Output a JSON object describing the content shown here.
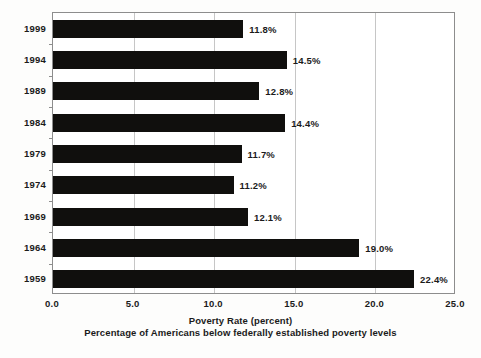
{
  "chart_data": {
    "type": "bar",
    "orientation": "horizontal",
    "title": "",
    "xlabel": "Poverty Rate (percent)",
    "subtitle": "Percentage of Americans below federally established poverty levels",
    "ylabel": "",
    "categories": [
      "1999",
      "1994",
      "1989",
      "1984",
      "1979",
      "1974",
      "1969",
      "1964",
      "1959"
    ],
    "values": [
      11.8,
      14.5,
      12.8,
      14.4,
      11.7,
      11.2,
      12.1,
      19.0,
      22.4
    ],
    "value_labels": [
      "11.8%",
      "14.5%",
      "12.8%",
      "14.4%",
      "11.7%",
      "11.2%",
      "12.1%",
      "19.0%",
      "22.4%"
    ],
    "xlim": [
      0.0,
      25.0
    ],
    "xticks": [
      0.0,
      5.0,
      10.0,
      15.0,
      20.0,
      25.0
    ],
    "xtick_labels": [
      "0.0",
      "5.0",
      "10.0",
      "15.0",
      "20.0",
      "25.0"
    ],
    "grid": true,
    "grid_axis": "x",
    "legend": false,
    "bar_color": "#100f0d",
    "grid_color": "#c6c6c6",
    "frame_color": "#8d8d8d",
    "background_color": "#ffffff"
  }
}
